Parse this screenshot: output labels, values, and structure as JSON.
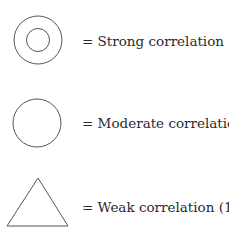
{
  "legend": {
    "items": [
      {
        "symbol": "double-circle",
        "label": "= Strong correlation (9)"
      },
      {
        "symbol": "circle",
        "label": "= Moderate correlation (3)"
      },
      {
        "symbol": "triangle",
        "label": "= Weak correlation (1)"
      }
    ],
    "stroke_color": "#555555"
  }
}
